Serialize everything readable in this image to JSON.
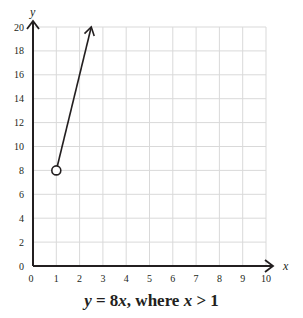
{
  "chart_data": {
    "type": "line",
    "title": "y = 8x, where x > 1",
    "title_parts": {
      "y": "y",
      "eq": " = 8",
      "x1": "x",
      "where": ", where ",
      "x2": "x",
      "cond": " > 1"
    },
    "xlabel": "x",
    "ylabel": "y",
    "xlim": [
      0,
      10
    ],
    "ylim": [
      0,
      20
    ],
    "x_ticks": [
      0,
      1,
      2,
      3,
      4,
      5,
      6,
      7,
      8,
      9,
      10
    ],
    "y_ticks": [
      0,
      2,
      4,
      6,
      8,
      10,
      12,
      14,
      16,
      18,
      20
    ],
    "grid": true,
    "series": [
      {
        "name": "y = 8x",
        "x": [
          1,
          2.5
        ],
        "y": [
          8,
          20
        ],
        "start_marker": "open-circle",
        "end_marker": "arrow"
      }
    ],
    "annotations": [
      {
        "type": "open-circle",
        "x": 1,
        "y": 8,
        "meaning": "excluded endpoint (x > 1)"
      }
    ]
  },
  "colors": {
    "axis": "#231f20",
    "grid": "#d9d9d9",
    "line": "#231f20"
  }
}
